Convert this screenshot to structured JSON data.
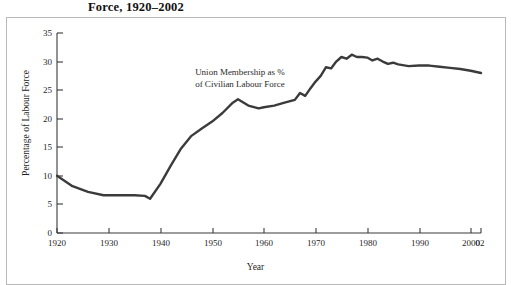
{
  "figure": {
    "title": "Force, 1920–2002",
    "annotation_line1": "Union Membership as %",
    "annotation_line2": "of Civilian Labour Force"
  },
  "axes": {
    "xlabel": "Year",
    "ylabel": "Percentage of Labour Force",
    "yticks": [
      "0",
      "5",
      "10",
      "15",
      "20",
      "25",
      "30",
      "35"
    ],
    "xticks": [
      "1920",
      "1930",
      "1940",
      "1950",
      "1960",
      "1970",
      "1980",
      "1990",
      "2000",
      "02"
    ]
  },
  "colors": {
    "line": "#3b3b3b",
    "axis": "#3a3a3a",
    "frame": "#b9b9b9",
    "text": "#1f1f1f",
    "background": "#ffffff"
  },
  "chart_data": {
    "type": "line",
    "title": "Force, 1920–2002",
    "xlabel": "Year",
    "ylabel": "Percentage of Labour Force",
    "xlim": [
      1920,
      2002
    ],
    "ylim": [
      0,
      35
    ],
    "ytick_values": [
      0,
      5,
      10,
      15,
      20,
      25,
      30,
      35
    ],
    "xtick_values": [
      1920,
      1930,
      1940,
      1950,
      1960,
      1970,
      1980,
      1990,
      2000,
      2002
    ],
    "grid": false,
    "legend": "none",
    "annotations": [
      {
        "text": "Union Membership as % of Civilian Labour Force",
        "x": 1950,
        "y": 27
      }
    ],
    "series": [
      {
        "name": "Union Membership as % of Civilian Labour Force",
        "color": "#3b3b3b",
        "x": [
          1920,
          1923,
          1926,
          1929,
          1931,
          1933,
          1935,
          1937,
          1938,
          1940,
          1942,
          1944,
          1946,
          1948,
          1950,
          1952,
          1954,
          1955,
          1957,
          1959,
          1960,
          1962,
          1964,
          1966,
          1967,
          1968,
          1969,
          1970,
          1971,
          1972,
          1973,
          1974,
          1975,
          1976,
          1977,
          1978,
          1979,
          1980,
          1981,
          1982,
          1983,
          1984,
          1985,
          1986,
          1988,
          1990,
          1992,
          1994,
          1996,
          1998,
          2000,
          2002
        ],
        "y": [
          10.0,
          8.2,
          7.2,
          6.6,
          6.6,
          6.6,
          6.6,
          6.5,
          6.0,
          8.6,
          11.8,
          14.8,
          17.0,
          18.3,
          19.5,
          21.0,
          22.8,
          23.4,
          22.3,
          21.8,
          22.0,
          22.3,
          22.8,
          23.3,
          24.5,
          24.0,
          25.3,
          26.5,
          27.5,
          29.0,
          28.8,
          30.0,
          30.8,
          30.5,
          31.2,
          30.8,
          30.8,
          30.7,
          30.2,
          30.5,
          30.0,
          29.6,
          29.8,
          29.5,
          29.2,
          29.3,
          29.3,
          29.1,
          28.9,
          28.7,
          28.4,
          28.0
        ]
      }
    ]
  }
}
